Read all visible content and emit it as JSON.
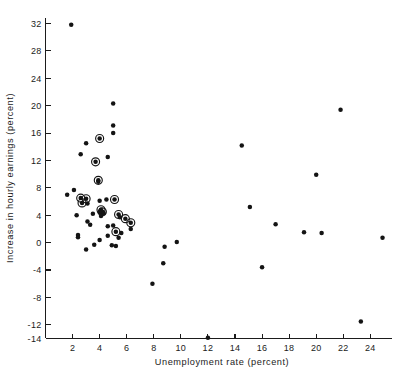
{
  "chart_data": {
    "type": "scatter",
    "title": "",
    "xlabel": "Unemployment rate (percent)",
    "ylabel": "Increase in hourly earnings (percent)",
    "xlim": [
      0,
      25.6
    ],
    "ylim": [
      -14,
      32.8
    ],
    "xticks": [
      2,
      4,
      6,
      8,
      10,
      12,
      14,
      16,
      18,
      20,
      22,
      24
    ],
    "xtick_labels": [
      "2",
      "4",
      "6",
      "8",
      "10",
      "12",
      "14",
      "16",
      "18",
      "20",
      "22",
      "24"
    ],
    "yticks": [
      -14,
      -12,
      -8,
      -4,
      0,
      4,
      8,
      12,
      16,
      20,
      24,
      28,
      32
    ],
    "ytick_labels": [
      "-14",
      "-12",
      "-8",
      "-4",
      "0",
      "4",
      "8",
      "12",
      "16",
      "20",
      "24",
      "28",
      "32"
    ],
    "grid": false,
    "legend": false,
    "marker_color": "#141414",
    "marker_styles": {
      "plain": "filled-dot",
      "circled": "filled-dot-with-open-ring"
    },
    "points": [
      {
        "x": 1.9,
        "y": 31.8,
        "style": "plain"
      },
      {
        "x": 5.0,
        "y": 20.3,
        "style": "plain"
      },
      {
        "x": 21.8,
        "y": 19.4,
        "style": "plain"
      },
      {
        "x": 5.0,
        "y": 17.1,
        "style": "plain"
      },
      {
        "x": 5.0,
        "y": 16.0,
        "style": "plain"
      },
      {
        "x": 4.0,
        "y": 15.2,
        "style": "circled"
      },
      {
        "x": 3.0,
        "y": 14.5,
        "style": "plain"
      },
      {
        "x": 14.5,
        "y": 14.2,
        "style": "plain"
      },
      {
        "x": 2.6,
        "y": 12.9,
        "style": "plain"
      },
      {
        "x": 4.6,
        "y": 12.5,
        "style": "plain"
      },
      {
        "x": 3.7,
        "y": 11.8,
        "style": "circled"
      },
      {
        "x": 20.0,
        "y": 9.9,
        "style": "plain"
      },
      {
        "x": 3.9,
        "y": 9.1,
        "style": "circled"
      },
      {
        "x": 3.9,
        "y": 8.9,
        "style": "plain"
      },
      {
        "x": 2.1,
        "y": 7.7,
        "style": "plain"
      },
      {
        "x": 1.6,
        "y": 7.0,
        "style": "plain"
      },
      {
        "x": 2.6,
        "y": 6.5,
        "style": "circled"
      },
      {
        "x": 3.0,
        "y": 6.4,
        "style": "circled"
      },
      {
        "x": 5.1,
        "y": 6.3,
        "style": "circled"
      },
      {
        "x": 4.5,
        "y": 6.3,
        "style": "plain"
      },
      {
        "x": 4.0,
        "y": 6.1,
        "style": "plain"
      },
      {
        "x": 2.7,
        "y": 5.8,
        "style": "circled"
      },
      {
        "x": 3.1,
        "y": 5.7,
        "style": "plain"
      },
      {
        "x": 15.1,
        "y": 5.2,
        "style": "plain"
      },
      {
        "x": 4.1,
        "y": 4.8,
        "style": "circled"
      },
      {
        "x": 4.2,
        "y": 4.5,
        "style": "circled"
      },
      {
        "x": 4.0,
        "y": 4.4,
        "style": "plain"
      },
      {
        "x": 4.3,
        "y": 4.3,
        "style": "plain"
      },
      {
        "x": 3.5,
        "y": 4.2,
        "style": "plain"
      },
      {
        "x": 5.4,
        "y": 4.1,
        "style": "circled"
      },
      {
        "x": 2.3,
        "y": 4.0,
        "style": "plain"
      },
      {
        "x": 4.1,
        "y": 3.9,
        "style": "plain"
      },
      {
        "x": 5.5,
        "y": 3.7,
        "style": "plain"
      },
      {
        "x": 5.9,
        "y": 3.5,
        "style": "circled"
      },
      {
        "x": 3.1,
        "y": 3.1,
        "style": "plain"
      },
      {
        "x": 6.3,
        "y": 2.9,
        "style": "circled"
      },
      {
        "x": 17.0,
        "y": 2.7,
        "style": "plain"
      },
      {
        "x": 3.3,
        "y": 2.6,
        "style": "plain"
      },
      {
        "x": 5.0,
        "y": 2.5,
        "style": "plain"
      },
      {
        "x": 4.6,
        "y": 2.4,
        "style": "plain"
      },
      {
        "x": 6.3,
        "y": 2.0,
        "style": "plain"
      },
      {
        "x": 5.2,
        "y": 1.6,
        "style": "circled"
      },
      {
        "x": 19.1,
        "y": 1.5,
        "style": "plain"
      },
      {
        "x": 5.6,
        "y": 1.4,
        "style": "plain"
      },
      {
        "x": 20.4,
        "y": 1.4,
        "style": "plain"
      },
      {
        "x": 2.4,
        "y": 1.1,
        "style": "plain"
      },
      {
        "x": 4.6,
        "y": 1.0,
        "style": "plain"
      },
      {
        "x": 2.4,
        "y": 0.8,
        "style": "plain"
      },
      {
        "x": 5.4,
        "y": 0.7,
        "style": "plain"
      },
      {
        "x": 24.9,
        "y": 0.7,
        "style": "plain"
      },
      {
        "x": 4.0,
        "y": 0.4,
        "style": "plain"
      },
      {
        "x": 9.7,
        "y": 0.1,
        "style": "plain"
      },
      {
        "x": 3.6,
        "y": -0.3,
        "style": "plain"
      },
      {
        "x": 4.9,
        "y": -0.4,
        "style": "plain"
      },
      {
        "x": 5.2,
        "y": -0.5,
        "style": "plain"
      },
      {
        "x": 8.8,
        "y": -0.6,
        "style": "plain"
      },
      {
        "x": 3.0,
        "y": -1.0,
        "style": "plain"
      },
      {
        "x": 8.7,
        "y": -3.0,
        "style": "plain"
      },
      {
        "x": 16.0,
        "y": -3.6,
        "style": "plain"
      },
      {
        "x": 7.9,
        "y": -6.0,
        "style": "plain"
      },
      {
        "x": 23.3,
        "y": -11.5,
        "style": "plain"
      },
      {
        "x": 12.0,
        "y": -13.9,
        "style": "plain"
      }
    ]
  }
}
